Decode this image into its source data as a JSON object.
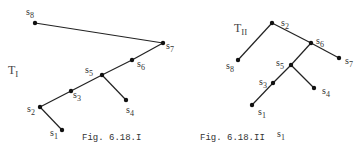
{
  "figures": [
    {
      "id": "fig-6-18-I",
      "tree_label": {
        "main": "T",
        "sub": "I"
      },
      "caption": "Fig. 6.18.I",
      "nodes": [
        {
          "name": "s8",
          "base": "s",
          "sub": "8",
          "x": 35,
          "y": 23,
          "lx": 26,
          "ly": 15,
          "anchor": "start"
        },
        {
          "name": "s7",
          "base": "s",
          "sub": "7",
          "x": 163,
          "y": 43,
          "lx": 166,
          "ly": 49,
          "anchor": "start"
        },
        {
          "name": "s6",
          "base": "s",
          "sub": "6",
          "x": 132,
          "y": 60,
          "lx": 137,
          "ly": 67,
          "anchor": "start"
        },
        {
          "name": "s5",
          "base": "s",
          "sub": "5",
          "x": 102,
          "y": 75,
          "lx": 85,
          "ly": 73,
          "anchor": "start"
        },
        {
          "name": "s3",
          "base": "s",
          "sub": "3",
          "x": 71,
          "y": 91,
          "lx": 73,
          "ly": 98,
          "anchor": "start"
        },
        {
          "name": "s2",
          "base": "s",
          "sub": "2",
          "x": 40,
          "y": 107,
          "lx": 27,
          "ly": 112,
          "anchor": "start"
        },
        {
          "name": "s1",
          "base": "s",
          "sub": "1",
          "x": 62,
          "y": 130,
          "lx": 50,
          "ly": 136,
          "anchor": "start"
        },
        {
          "name": "s4",
          "base": "s",
          "sub": "4",
          "x": 126,
          "y": 100,
          "lx": 126,
          "ly": 113,
          "anchor": "start"
        }
      ],
      "edges": [
        [
          "s8",
          "s7"
        ],
        [
          "s7",
          "s6"
        ],
        [
          "s6",
          "s5"
        ],
        [
          "s5",
          "s3"
        ],
        [
          "s3",
          "s2"
        ],
        [
          "s2",
          "s1"
        ],
        [
          "s5",
          "s4"
        ]
      ],
      "tree_label_pos": {
        "x": 8,
        "y": 74
      },
      "caption_pos": {
        "x": 82,
        "y": 140
      }
    },
    {
      "id": "fig-6-18-II",
      "tree_label": {
        "main": "T",
        "sub": "II"
      },
      "caption": "Fig. 6.18.II",
      "caption_extra": {
        "base": "s",
        "sub": "1"
      },
      "nodes": [
        {
          "name": "s2",
          "base": "s",
          "sub": "2",
          "x": 272,
          "y": 23,
          "lx": 281,
          "ly": 26,
          "anchor": "start"
        },
        {
          "name": "s8",
          "base": "s",
          "sub": "8",
          "x": 238,
          "y": 60,
          "lx": 226,
          "ly": 69,
          "anchor": "start"
        },
        {
          "name": "s6",
          "base": "s",
          "sub": "6",
          "x": 311,
          "y": 43,
          "lx": 316,
          "ly": 44,
          "anchor": "start"
        },
        {
          "name": "s7",
          "base": "s",
          "sub": "7",
          "x": 339,
          "y": 58,
          "lx": 345,
          "ly": 64,
          "anchor": "start"
        },
        {
          "name": "s5",
          "base": "s",
          "sub": "5",
          "x": 291,
          "y": 65,
          "lx": 276,
          "ly": 66,
          "anchor": "start"
        },
        {
          "name": "s3",
          "base": "s",
          "sub": "3",
          "x": 273,
          "y": 83,
          "lx": 259,
          "ly": 85,
          "anchor": "start"
        },
        {
          "name": "s4",
          "base": "s",
          "sub": "4",
          "x": 314,
          "y": 88,
          "lx": 322,
          "ly": 94,
          "anchor": "start"
        },
        {
          "name": "s1",
          "base": "s",
          "sub": "1",
          "x": 252,
          "y": 105,
          "lx": 258,
          "ly": 115,
          "anchor": "start"
        }
      ],
      "edges": [
        [
          "s2",
          "s8"
        ],
        [
          "s2",
          "s6"
        ],
        [
          "s6",
          "s7"
        ],
        [
          "s6",
          "s5"
        ],
        [
          "s5",
          "s3"
        ],
        [
          "s3",
          "s1"
        ],
        [
          "s5",
          "s4"
        ]
      ],
      "tree_label_pos": {
        "x": 234,
        "y": 32
      },
      "caption_pos": {
        "x": 200,
        "y": 140
      },
      "caption_extra_pos": {
        "x": 277,
        "y": 137
      }
    }
  ]
}
